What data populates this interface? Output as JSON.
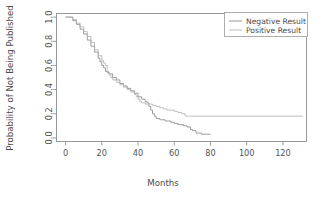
{
  "chart_data": {
    "type": "line",
    "title": "",
    "subtitle": "",
    "xlabel": "Months",
    "ylabel": "Probability of Not Being Published",
    "xlim": [
      -5,
      133
    ],
    "ylim": [
      -0.03,
      1.03
    ],
    "xticks": [
      0,
      20,
      40,
      60,
      80,
      100,
      120
    ],
    "xtick_labels": [
      "0",
      "20",
      "40",
      "60",
      "80",
      "100",
      "120"
    ],
    "yticks": [
      0.0,
      0.2,
      0.4,
      0.6,
      0.8,
      1.0
    ],
    "ytick_labels": [
      "0.0",
      "0.2",
      "0.4",
      "0.6",
      "0.8",
      "1.0"
    ],
    "grid": false,
    "legend_position": "top-right",
    "legend_entries": [
      "Negative Result",
      "Positive Result"
    ],
    "series": [
      {
        "name": "Negative Result",
        "color": "#8c8c8c",
        "step": "post",
        "x": [
          0,
          2,
          4,
          6,
          8,
          10,
          12,
          14,
          16,
          18,
          19,
          20,
          21,
          22,
          23,
          24,
          26,
          28,
          30,
          32,
          34,
          36,
          38,
          40,
          42,
          44,
          45,
          46,
          47,
          48,
          49,
          50,
          52,
          55,
          58,
          60,
          62,
          65,
          67,
          69,
          70,
          72,
          75,
          80
        ],
        "y": [
          1.0,
          1.0,
          0.97,
          0.94,
          0.9,
          0.86,
          0.81,
          0.76,
          0.71,
          0.66,
          0.63,
          0.6,
          0.58,
          0.55,
          0.54,
          0.53,
          0.5,
          0.48,
          0.45,
          0.43,
          0.41,
          0.39,
          0.37,
          0.34,
          0.32,
          0.3,
          0.29,
          0.26,
          0.23,
          0.2,
          0.18,
          0.16,
          0.15,
          0.14,
          0.13,
          0.12,
          0.11,
          0.1,
          0.09,
          0.07,
          0.06,
          0.04,
          0.03,
          0.03
        ]
      },
      {
        "name": "Positive Result",
        "color": "#b5b5b5",
        "step": "post",
        "x": [
          0,
          2,
          4,
          6,
          8,
          10,
          12,
          14,
          16,
          18,
          20,
          21,
          22,
          23,
          24,
          25,
          26,
          28,
          30,
          32,
          34,
          36,
          38,
          39,
          40,
          41,
          42,
          44,
          46,
          48,
          50,
          52,
          54,
          56,
          58,
          60,
          62,
          64,
          66,
          68,
          80,
          100,
          120,
          131
        ],
        "y": [
          1.0,
          1.0,
          0.98,
          0.95,
          0.92,
          0.88,
          0.84,
          0.79,
          0.73,
          0.68,
          0.64,
          0.62,
          0.6,
          0.55,
          0.52,
          0.5,
          0.48,
          0.46,
          0.44,
          0.42,
          0.4,
          0.38,
          0.36,
          0.34,
          0.32,
          0.3,
          0.29,
          0.28,
          0.28,
          0.27,
          0.26,
          0.25,
          0.24,
          0.23,
          0.23,
          0.22,
          0.21,
          0.2,
          0.18,
          0.18,
          0.18,
          0.18,
          0.18,
          0.18
        ]
      }
    ]
  },
  "colors": {
    "negative_series": "#8c8c8c",
    "positive_series": "#b5b5b5",
    "axis": "#8e8e8e",
    "text": "#4a4a4a",
    "background": "#ffffff"
  }
}
